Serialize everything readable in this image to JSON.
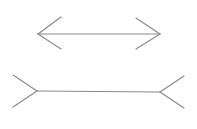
{
  "diagram": {
    "type": "muller-lyer-illusion",
    "stroke_color": "#8a8a8a",
    "background": "#ffffff",
    "figures": [
      {
        "name": "arrows-inward-line",
        "shaft": {
          "x1": 38,
          "y1": 34,
          "x2": 160,
          "y2": 34
        },
        "fins": [
          {
            "x1": 38,
            "y1": 34,
            "x2": 61,
            "y2": 17
          },
          {
            "x1": 38,
            "y1": 34,
            "x2": 61,
            "y2": 49
          },
          {
            "x1": 160,
            "y1": 34,
            "x2": 136,
            "y2": 18
          },
          {
            "x1": 160,
            "y1": 34,
            "x2": 136,
            "y2": 49
          }
        ]
      },
      {
        "name": "fins-outward-line",
        "shaft": {
          "x1": 37,
          "y1": 91,
          "x2": 160,
          "y2": 92
        },
        "fins": [
          {
            "x1": 37,
            "y1": 91,
            "x2": 13,
            "y2": 75
          },
          {
            "x1": 37,
            "y1": 91,
            "x2": 13,
            "y2": 107
          },
          {
            "x1": 160,
            "y1": 92,
            "x2": 184,
            "y2": 76
          },
          {
            "x1": 160,
            "y1": 92,
            "x2": 184,
            "y2": 108
          }
        ]
      }
    ]
  }
}
